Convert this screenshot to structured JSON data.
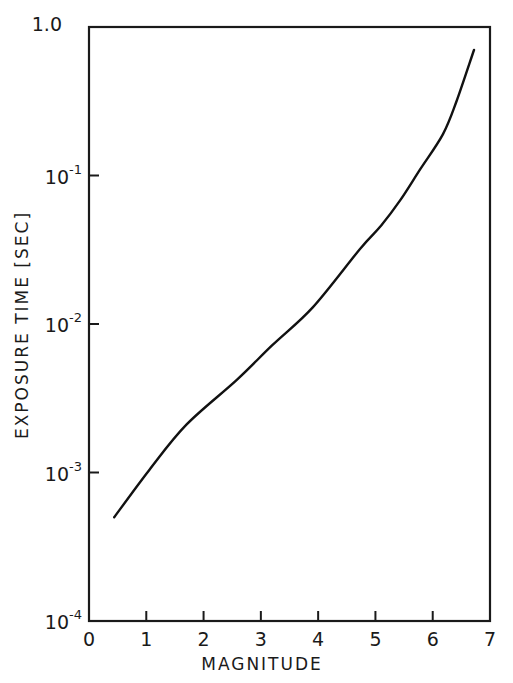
{
  "chart_data": {
    "type": "line",
    "title": "",
    "xlabel": "MAGNITUDE",
    "ylabel": "EXPOSURE TIME [SEC]",
    "xlim": [
      0,
      7
    ],
    "ylim": [
      0.0001,
      1.0
    ],
    "yscale": "log",
    "grid": false,
    "legend": null,
    "x_ticks": [
      "0",
      "1",
      "2",
      "3",
      "4",
      "5",
      "6",
      "7"
    ],
    "y_ticks": [
      {
        "value": 1.0,
        "base": "1.0",
        "exp": ""
      },
      {
        "value": 0.1,
        "base": "10",
        "exp": "-1"
      },
      {
        "value": 0.01,
        "base": "10",
        "exp": "-2"
      },
      {
        "value": 0.001,
        "base": "10",
        "exp": "-3"
      },
      {
        "value": 0.0001,
        "base": "10",
        "exp": "-4"
      }
    ],
    "series": [
      {
        "name": "exposure time",
        "x": [
          0.44,
          1.06,
          1.7,
          2.58,
          3.2,
          3.91,
          4.73,
          5.1,
          5.43,
          5.78,
          6.18,
          6.42,
          6.72
        ],
        "y": [
          0.0005,
          0.00105,
          0.0021,
          0.0042,
          0.0072,
          0.013,
          0.032,
          0.046,
          0.068,
          0.11,
          0.19,
          0.32,
          0.7
        ]
      }
    ]
  }
}
